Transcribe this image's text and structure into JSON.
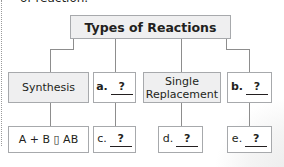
{
  "header": {
    "cut_off_text": "of reaction."
  },
  "diagram": {
    "title": "Types of Reactions",
    "categories": [
      {
        "label": "Synthesis",
        "example": "A + B → AB"
      },
      {
        "blank_letter": "a.",
        "blank_value": "?",
        "example_letter": "c.",
        "example_value": "?"
      },
      {
        "label": "Single Replacement",
        "label_line1": "Single",
        "label_line2": "Replacement",
        "example_letter": "d.",
        "example_value": "?"
      },
      {
        "blank_letter": "b.",
        "blank_value": "?",
        "example_letter": "e.",
        "example_value": "?"
      }
    ],
    "example_glyph_rendered": "A + B ▯ AB"
  },
  "colors": {
    "box_border": "#a7a9ac",
    "shaded_fill": "#efeff0",
    "connector": "#8d8d8d",
    "text": "#231f20"
  }
}
